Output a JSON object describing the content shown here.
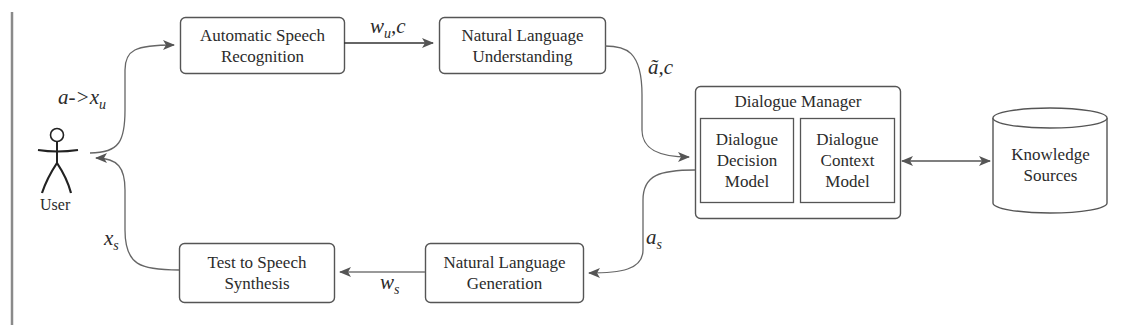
{
  "diagram": {
    "type": "spoken-dialogue-system-architecture",
    "actor": {
      "label": "User"
    },
    "nodes": {
      "asr": {
        "line1": "Automatic Speech",
        "line2": "Recognition"
      },
      "nlu": {
        "line1": "Natural Language",
        "line2": "Understanding"
      },
      "dm": {
        "title": "Dialogue Manager",
        "decision": {
          "line1": "Dialogue",
          "line2": "Decision",
          "line3": "Model"
        },
        "context": {
          "line1": "Dialogue",
          "line2": "Context",
          "line3": "Model"
        }
      },
      "ks": {
        "line1": "Knowledge",
        "line2": "Sources"
      },
      "nlg": {
        "line1": "Natural Language",
        "line2": "Generation"
      },
      "tts": {
        "line1": "Test to Speech",
        "line2": "Synthesis"
      }
    },
    "edges": {
      "user_to_asr": {
        "base": "a->x",
        "sub": "u"
      },
      "asr_to_nlu": {
        "base": "w",
        "sub": "u",
        "tail": ",c"
      },
      "nlu_to_dm": {
        "base": "ã,c"
      },
      "dm_to_nlg": {
        "base": "a",
        "sub": "s"
      },
      "nlg_to_tts": {
        "base": "w",
        "sub": "s"
      },
      "tts_to_user": {
        "base": "x",
        "sub": "s"
      },
      "dm_ks": {
        "label": "bidirectional"
      }
    },
    "colors": {
      "stroke": "#555555",
      "arrow": "#666666",
      "text": "#2b2b2b",
      "sidebar": "#8a8a8a"
    }
  }
}
